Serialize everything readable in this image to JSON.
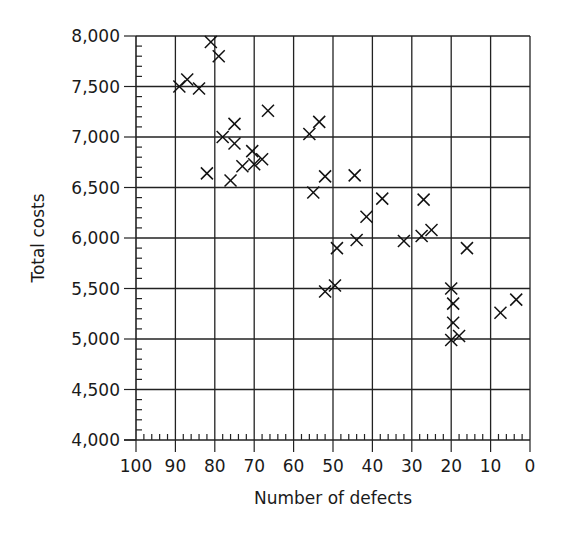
{
  "chart_data": {
    "type": "scatter",
    "title": "",
    "xlabel": "Number of defects",
    "ylabel": "Total costs",
    "xlim": [
      100,
      0
    ],
    "ylim": [
      4000,
      8000
    ],
    "x_reversed": true,
    "grid": true,
    "marker": "x",
    "x_ticks": [
      100,
      90,
      80,
      70,
      60,
      50,
      40,
      30,
      20,
      10,
      0
    ],
    "x_tick_labels": [
      "100",
      "90",
      "80",
      "70",
      "60",
      "50",
      "40",
      "30",
      "20",
      "10",
      "0"
    ],
    "x_minor_step": 2,
    "y_ticks": [
      4000,
      4500,
      5000,
      5500,
      6000,
      6500,
      7000,
      7500,
      8000
    ],
    "y_tick_labels": [
      "4,000",
      "4,500",
      "5,000",
      "5,500",
      "6,000",
      "6,500",
      "7,000",
      "7,500",
      "8,000"
    ],
    "y_minor_step": 100,
    "points": [
      {
        "x": 89,
        "y": 7500
      },
      {
        "x": 87,
        "y": 7570
      },
      {
        "x": 84,
        "y": 7480
      },
      {
        "x": 81,
        "y": 7940
      },
      {
        "x": 79,
        "y": 7800
      },
      {
        "x": 66.5,
        "y": 7260
      },
      {
        "x": 75,
        "y": 7130
      },
      {
        "x": 78,
        "y": 7000
      },
      {
        "x": 75,
        "y": 6935
      },
      {
        "x": 70.5,
        "y": 6860
      },
      {
        "x": 68,
        "y": 6780
      },
      {
        "x": 73,
        "y": 6710
      },
      {
        "x": 70,
        "y": 6730
      },
      {
        "x": 82,
        "y": 6640
      },
      {
        "x": 76,
        "y": 6570
      },
      {
        "x": 53.5,
        "y": 7150
      },
      {
        "x": 56,
        "y": 7030
      },
      {
        "x": 52,
        "y": 6610
      },
      {
        "x": 44.5,
        "y": 6620
      },
      {
        "x": 55,
        "y": 6450
      },
      {
        "x": 37.5,
        "y": 6390
      },
      {
        "x": 27,
        "y": 6380
      },
      {
        "x": 41.5,
        "y": 6210
      },
      {
        "x": 49,
        "y": 5900
      },
      {
        "x": 44,
        "y": 5980
      },
      {
        "x": 32,
        "y": 5970
      },
      {
        "x": 27.5,
        "y": 6020
      },
      {
        "x": 25,
        "y": 6080
      },
      {
        "x": 16,
        "y": 5900
      },
      {
        "x": 49.5,
        "y": 5530
      },
      {
        "x": 52,
        "y": 5470
      },
      {
        "x": 20,
        "y": 5500
      },
      {
        "x": 19.5,
        "y": 5350
      },
      {
        "x": 19.5,
        "y": 5160
      },
      {
        "x": 20,
        "y": 4990
      },
      {
        "x": 18,
        "y": 5030
      },
      {
        "x": 7.5,
        "y": 5260
      },
      {
        "x": 3.5,
        "y": 5390
      }
    ]
  }
}
